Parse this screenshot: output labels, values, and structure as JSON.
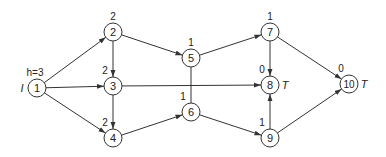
{
  "diagram": {
    "type": "directed-network",
    "stroke_color": "#333333",
    "nodes": [
      {
        "id": "1",
        "x": 37,
        "y": 88,
        "label": "1",
        "value": "h=3",
        "side_label": "I",
        "side": "left"
      },
      {
        "id": "2",
        "x": 113,
        "y": 32,
        "label": "2",
        "value": "2"
      },
      {
        "id": "3",
        "x": 113,
        "y": 86,
        "label": "3",
        "value": "2"
      },
      {
        "id": "4",
        "x": 113,
        "y": 138,
        "label": "4",
        "value": "2"
      },
      {
        "id": "5",
        "x": 191,
        "y": 58,
        "label": "5",
        "value": "1"
      },
      {
        "id": "6",
        "x": 191,
        "y": 112,
        "label": "6",
        "value": "1"
      },
      {
        "id": "7",
        "x": 270,
        "y": 32,
        "label": "7",
        "value": "1"
      },
      {
        "id": "8",
        "x": 270,
        "y": 85,
        "label": "8",
        "value": "0",
        "side_label": "T",
        "side": "right"
      },
      {
        "id": "9",
        "x": 270,
        "y": 138,
        "label": "9",
        "value": "1"
      },
      {
        "id": "10",
        "x": 349,
        "y": 84,
        "label": "10",
        "value": "0",
        "side_label": "T",
        "side": "right"
      }
    ],
    "edges": [
      {
        "from": "1",
        "to": "2",
        "arrow": true
      },
      {
        "from": "1",
        "to": "3",
        "arrow": true
      },
      {
        "from": "1",
        "to": "4",
        "arrow": true
      },
      {
        "from": "2",
        "to": "3",
        "arrow": true
      },
      {
        "from": "2",
        "to": "5",
        "arrow": true
      },
      {
        "from": "3",
        "to": "4",
        "arrow": true
      },
      {
        "from": "3",
        "to": "8",
        "arrow": true
      },
      {
        "from": "4",
        "to": "6",
        "arrow": true
      },
      {
        "from": "5",
        "to": "6",
        "arrow": false
      },
      {
        "from": "5",
        "to": "7",
        "arrow": true
      },
      {
        "from": "6",
        "to": "9",
        "arrow": true
      },
      {
        "from": "7",
        "to": "8",
        "arrow": true
      },
      {
        "from": "7",
        "to": "10",
        "arrow": true
      },
      {
        "from": "9",
        "to": "8",
        "arrow": true
      },
      {
        "from": "9",
        "to": "10",
        "arrow": true
      }
    ]
  }
}
